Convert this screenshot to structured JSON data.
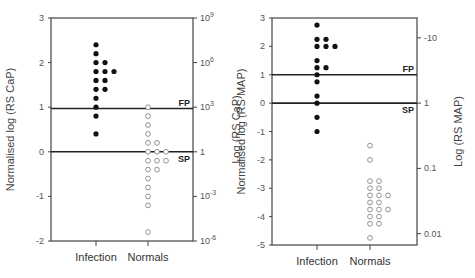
{
  "chart_data": [
    {
      "type": "scatter",
      "title": "",
      "xlabel": "",
      "ylabel": "Normalised log (RS CaP)",
      "ylabel_right": "Log (RS CaP)",
      "categories": [
        "Infection",
        "Normals"
      ],
      "ylim": [
        -2,
        3
      ],
      "yticks": [
        -2,
        -1,
        0,
        1,
        2,
        3
      ],
      "ytick_labels": [
        "-2",
        "-1",
        "0",
        "1",
        "2",
        "3"
      ],
      "right_ticks": [
        {
          "y": 3,
          "label": "10^9"
        },
        {
          "y": 2,
          "label": "10^6"
        },
        {
          "y": 1,
          "label": "10^3"
        },
        {
          "y": 0,
          "label": "1"
        },
        {
          "y": -1,
          "label": "10^-3"
        },
        {
          "y": -2,
          "label": "10^-6"
        }
      ],
      "thresholds": [
        {
          "label": "FP",
          "y": 0.97
        },
        {
          "label": "SP",
          "y": 0.0
        }
      ],
      "grid": false,
      "series": [
        {
          "name": "Infection",
          "marker": "filled",
          "points": [
            [
              0,
              2.4
            ],
            [
              0,
              2.2
            ],
            [
              0,
              2.0
            ],
            [
              1,
              2.0
            ],
            [
              0,
              1.8
            ],
            [
              1,
              1.8
            ],
            [
              2,
              1.8
            ],
            [
              0,
              1.6
            ],
            [
              1,
              1.6
            ],
            [
              0,
              1.4
            ],
            [
              1,
              1.4
            ],
            [
              0,
              1.2
            ],
            [
              0,
              1.0
            ],
            [
              0,
              0.8
            ],
            [
              0,
              0.4
            ]
          ]
        },
        {
          "name": "Normals",
          "marker": "open",
          "points": [
            [
              0,
              1.0
            ],
            [
              0,
              0.8
            ],
            [
              0,
              0.6
            ],
            [
              0,
              0.4
            ],
            [
              0,
              0.2
            ],
            [
              1,
              0.2
            ],
            [
              0,
              0.0
            ],
            [
              1,
              0.0
            ],
            [
              2,
              0.0
            ],
            [
              0,
              -0.2
            ],
            [
              1,
              -0.2
            ],
            [
              2,
              -0.2
            ],
            [
              0,
              -0.4
            ],
            [
              1,
              -0.4
            ],
            [
              0,
              -0.6
            ],
            [
              0,
              -0.8
            ],
            [
              0,
              -1.0
            ],
            [
              0,
              -1.2
            ],
            [
              0,
              -1.8
            ]
          ]
        }
      ]
    },
    {
      "type": "scatter",
      "title": "",
      "xlabel": "",
      "ylabel": "Normalised log (RS MAP)",
      "ylabel_right": "Log (RS MAP)",
      "categories": [
        "Infection",
        "Normals"
      ],
      "ylim": [
        -5,
        3
      ],
      "yticks": [
        -5,
        -4,
        -3,
        -2,
        -1,
        0,
        1,
        2,
        3
      ],
      "ytick_labels": [
        "-5",
        "-4",
        "-3",
        "-2",
        "-1",
        "0",
        "1",
        "2",
        "3"
      ],
      "right_ticks": [
        {
          "y": 2.3,
          "label": "-10"
        },
        {
          "y": 0,
          "label": "1"
        },
        {
          "y": -2.3,
          "label": "0.1"
        },
        {
          "y": -4.6,
          "label": "0.01"
        }
      ],
      "thresholds": [
        {
          "label": "FP",
          "y": 1.0
        },
        {
          "label": "SP",
          "y": 0.0
        }
      ],
      "grid": false,
      "series": [
        {
          "name": "Infection",
          "marker": "filled",
          "points": [
            [
              0,
              2.75
            ],
            [
              0,
              2.25
            ],
            [
              1,
              2.25
            ],
            [
              0,
              2.0
            ],
            [
              1,
              2.0
            ],
            [
              2,
              2.0
            ],
            [
              0,
              1.5
            ],
            [
              0,
              1.25
            ],
            [
              1,
              1.25
            ],
            [
              0,
              1.0
            ],
            [
              0,
              0.75
            ],
            [
              0,
              0.25
            ],
            [
              0,
              0.0
            ],
            [
              0,
              -0.5
            ],
            [
              0,
              -1.0
            ]
          ]
        },
        {
          "name": "Normals",
          "marker": "open",
          "points": [
            [
              0,
              -1.5
            ],
            [
              0,
              -2.0
            ],
            [
              0,
              -2.75
            ],
            [
              1,
              -2.75
            ],
            [
              0,
              -3.0
            ],
            [
              1,
              -3.0
            ],
            [
              0,
              -3.25
            ],
            [
              1,
              -3.25
            ],
            [
              2,
              -3.25
            ],
            [
              0,
              -3.5
            ],
            [
              1,
              -3.5
            ],
            [
              0,
              -3.75
            ],
            [
              1,
              -3.75
            ],
            [
              2,
              -3.75
            ],
            [
              0,
              -4.0
            ],
            [
              1,
              -4.0
            ],
            [
              0,
              -4.25
            ],
            [
              1,
              -4.25
            ],
            [
              0,
              -4.75
            ]
          ]
        }
      ]
    }
  ]
}
